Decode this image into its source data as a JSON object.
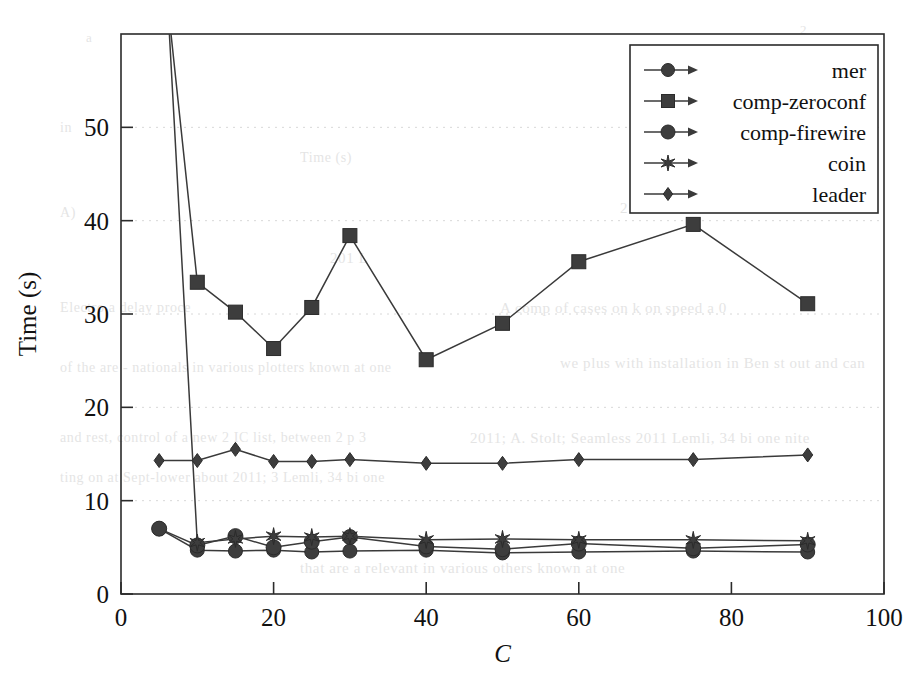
{
  "chart_data": {
    "type": "line",
    "title": "",
    "xlabel": "C",
    "ylabel": "Time (s)",
    "xlim": [
      0,
      100
    ],
    "ylim": [
      0,
      60
    ],
    "xticks": [
      0,
      20,
      40,
      60,
      80,
      100
    ],
    "xtick_labels": [
      "0",
      "20",
      "40",
      "60",
      "80",
      "100"
    ],
    "yticks": [
      0,
      10,
      20,
      30,
      40,
      50
    ],
    "ytick_labels": [
      "0",
      "10",
      "20",
      "30",
      "40",
      "50"
    ],
    "grid": "horizontal-dotted-faint",
    "legend_position": "top-right-inside",
    "series": [
      {
        "name": "mer",
        "marker": "circle",
        "x": [
          5,
          10,
          15,
          20,
          25,
          30,
          40,
          50,
          60,
          75,
          90
        ],
        "values": [
          7.0,
          4.7,
          4.6,
          4.7,
          4.5,
          4.6,
          4.7,
          4.4,
          4.5,
          4.6,
          4.5
        ]
      },
      {
        "name": "comp-zeroconf",
        "marker": "square",
        "x": [
          5,
          10,
          15,
          20,
          25,
          30,
          40,
          50,
          60,
          75,
          90
        ],
        "values": [
          72.0,
          33.4,
          30.2,
          26.3,
          30.7,
          38.4,
          25.1,
          29.0,
          35.6,
          39.6,
          31.1
        ]
      },
      {
        "name": "comp-firewire",
        "marker": "filled-circle",
        "x": [
          5,
          10,
          15,
          20,
          25,
          30,
          40,
          50,
          60,
          75,
          90
        ],
        "values": [
          7.0,
          5.2,
          6.2,
          5.0,
          5.6,
          6.1,
          5.1,
          4.8,
          5.4,
          4.9,
          5.3
        ]
      },
      {
        "name": "coin",
        "marker": "star",
        "x": [
          5,
          10,
          15,
          20,
          25,
          30,
          40,
          50,
          60,
          75,
          90
        ],
        "values": [
          80.0,
          5.5,
          5.9,
          6.2,
          6.1,
          6.2,
          5.8,
          5.9,
          5.8,
          5.8,
          5.7
        ]
      },
      {
        "name": "leader",
        "marker": "diamond",
        "x": [
          5,
          10,
          15,
          20,
          25,
          30,
          40,
          50,
          60,
          75,
          90
        ],
        "values": [
          14.3,
          14.3,
          15.5,
          14.2,
          14.2,
          14.4,
          14.0,
          14.0,
          14.4,
          14.4,
          14.9
        ]
      }
    ]
  },
  "legend": {
    "entries": [
      {
        "label": "mer",
        "marker": "circle"
      },
      {
        "label": "comp-zeroconf",
        "marker": "square"
      },
      {
        "label": "comp-firewire",
        "marker": "filled-circle"
      },
      {
        "label": "coin",
        "marker": "star"
      },
      {
        "label": "leader",
        "marker": "diamond"
      }
    ]
  },
  "background_text": [
    "a",
    "2",
    "in",
    "V",
    "Time (s)",
    "2",
    "A)",
    "201 L",
    "Electro a delay proce",
    "A comp of cases on k on speed a 0",
    "of the are - nationals in various plotters known at one",
    "we plus with installation in Ben st out and can",
    "and rest, control of a new 2 IC  list, between 2 p 3",
    "2011; A. Stolt; Seamless 2011 Lemli, 34 bi one nite",
    "ting on at Sept-lower about 2011; 3 Lemli, 34 bi one",
    "that are a relevant in various others known at one"
  ],
  "geometry": {
    "plot_left": 121,
    "plot_right": 884,
    "plot_top": 34,
    "plot_bottom": 594
  }
}
